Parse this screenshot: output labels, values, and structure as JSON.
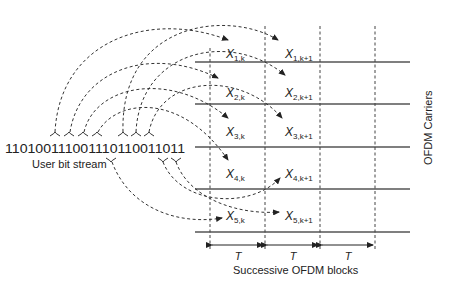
{
  "diagram": {
    "bit_stream": "11010011100111011001 1011",
    "bit_stream_full": "110100111001110110011011",
    "bit_stream_label": "User bit stream",
    "carriers_label": "OFDM Carriers",
    "blocks_label": "Successive OFDM blocks",
    "period_labels": [
      "T",
      "T",
      "T"
    ],
    "symbols_block_k": [
      {
        "base": "X",
        "sub": "1,k"
      },
      {
        "base": "X",
        "sub": "2,k"
      },
      {
        "base": "X",
        "sub": "3,k"
      },
      {
        "base": "X",
        "sub": "4,k"
      },
      {
        "base": "X",
        "sub": "5,k"
      }
    ],
    "symbols_block_k1": [
      {
        "base": "X",
        "sub": "1,k+1"
      },
      {
        "base": "X",
        "sub": "2,k+1"
      },
      {
        "base": "X",
        "sub": "3,k+1"
      },
      {
        "base": "X",
        "sub": "4,k+1"
      },
      {
        "base": "X",
        "sub": "5,k+1"
      }
    ],
    "colors": {
      "line": "#555555",
      "text": "#222222",
      "background": "#ffffff"
    }
  }
}
